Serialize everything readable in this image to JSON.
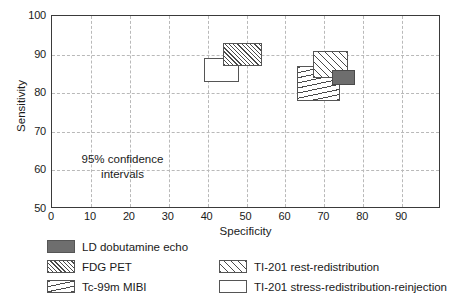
{
  "chart_data": {
    "type": "scatter",
    "title": "",
    "subtitle": "",
    "xlabel": "Specificity",
    "ylabel": "Sensitivity",
    "xlim": [
      0,
      100
    ],
    "ylim": [
      50,
      100
    ],
    "xticks": [
      0,
      10,
      20,
      30,
      40,
      50,
      60,
      70,
      80,
      90
    ],
    "yticks": [
      50,
      60,
      70,
      80,
      90,
      100
    ],
    "xtick_labels": [
      "0",
      "10",
      "20",
      "30",
      "40",
      "50",
      "60",
      "70",
      "80",
      "90"
    ],
    "ytick_labels": [
      "50",
      "60",
      "70",
      "80",
      "90",
      "100"
    ],
    "grid": true,
    "legend_position": "below",
    "annotations": [
      {
        "text_line1": "95% confidence",
        "text_line2": "intervals",
        "x": 16,
        "y": 60
      }
    ],
    "note": "Each item is a rectangular 95% confidence interval box; x range = specificity interval, y range = sensitivity interval.",
    "series": [
      {
        "name": "LD dobutamine echo",
        "fill": "solid",
        "color": "#6e6e6e",
        "x_low": 72,
        "x_high": 78,
        "y_low": 82,
        "y_high": 86
      },
      {
        "name": "FDG PET",
        "fill": "hatch-dense",
        "color": "#4a4a4a",
        "x_low": 44,
        "x_high": 54,
        "y_low": 87,
        "y_high": 93
      },
      {
        "name": "Tc-99m MIBI",
        "fill": "horiz",
        "color": "#4a4a4a",
        "x_low": 63,
        "x_high": 74,
        "y_low": 78,
        "y_high": 87
      },
      {
        "name": "TI-201 rest-redistribution",
        "fill": "hatch-coarse",
        "color": "#4a4a4a",
        "x_low": 67,
        "x_high": 76,
        "y_low": 84,
        "y_high": 91
      },
      {
        "name": "TI-201 stress-redistribution-reinjection",
        "fill": "none",
        "color": "#ffffff",
        "x_low": 39,
        "x_high": 48,
        "y_low": 83,
        "y_high": 89
      }
    ]
  },
  "legend": {
    "items": [
      {
        "label": "LD dobutamine echo",
        "swatch": "solid-gray-swatch"
      },
      {
        "label": "FDG PET",
        "swatch": "dense-diagonal-hatch-swatch"
      },
      {
        "label": "Tc-99m MIBI",
        "swatch": "horizontal-lines-swatch"
      },
      {
        "label": "TI-201 rest-redistribution",
        "swatch": "coarse-diagonal-hatch-swatch"
      },
      {
        "label": "TI-201 stress-redistribution-reinjection",
        "swatch": "empty-white-swatch"
      }
    ]
  }
}
